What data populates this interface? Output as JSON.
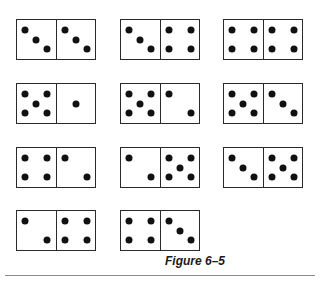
{
  "figure": {
    "caption": "Figure 6–5",
    "pip_color": "#111111",
    "border_color": "#2a2a2a",
    "rule_color": "#8a8a8a"
  },
  "dominoes": [
    {
      "row": 1,
      "col": 1,
      "left": 3,
      "right": 3,
      "x": 16,
      "y": 19
    },
    {
      "row": 1,
      "col": 2,
      "left": 3,
      "right": 4,
      "x": 120,
      "y": 19
    },
    {
      "row": 1,
      "col": 3,
      "left": 4,
      "right": 4,
      "x": 223,
      "y": 19
    },
    {
      "row": 2,
      "col": 1,
      "left": 5,
      "right": 1,
      "x": 16,
      "y": 83
    },
    {
      "row": 2,
      "col": 2,
      "left": 5,
      "right": 2,
      "x": 120,
      "y": 83
    },
    {
      "row": 2,
      "col": 3,
      "left": 5,
      "right": 3,
      "x": 223,
      "y": 83
    },
    {
      "row": 3,
      "col": 1,
      "left": 4,
      "right": 2,
      "x": 16,
      "y": 147
    },
    {
      "row": 3,
      "col": 2,
      "left": 2,
      "right": 5,
      "x": 120,
      "y": 147
    },
    {
      "row": 3,
      "col": 3,
      "left": 3,
      "right": 5,
      "x": 223,
      "y": 147
    },
    {
      "row": 4,
      "col": 1,
      "left": 2,
      "right": 4,
      "x": 16,
      "y": 210
    },
    {
      "row": 4,
      "col": 2,
      "left": 4,
      "right": 3,
      "x": 120,
      "y": 210
    }
  ]
}
